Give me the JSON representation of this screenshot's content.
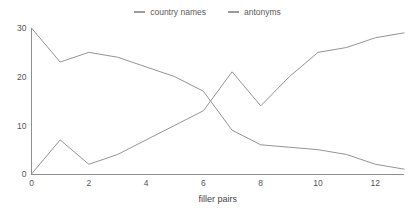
{
  "chart_data": {
    "type": "line",
    "title": "",
    "xlabel": "filler pairs",
    "ylabel": "",
    "xlim": [
      0,
      13
    ],
    "ylim": [
      0,
      30
    ],
    "xticks": [
      0,
      2,
      4,
      6,
      8,
      10,
      12
    ],
    "yticks": [
      0,
      10,
      20,
      30
    ],
    "grid": false,
    "legend_position": "top-center",
    "x": [
      0,
      1,
      2,
      3,
      4,
      5,
      6,
      7,
      8,
      9,
      10,
      11,
      12,
      13
    ],
    "series": [
      {
        "name": "country names",
        "color": "#949494",
        "values": [
          30,
          23,
          25,
          24,
          22,
          20,
          17,
          9,
          6,
          5.5,
          5,
          4,
          2,
          1
        ]
      },
      {
        "name": "antonyms",
        "color": "#949494",
        "values": [
          0,
          7,
          2,
          4,
          7,
          10,
          13,
          21,
          14,
          20,
          25,
          26,
          28,
          29
        ]
      }
    ]
  },
  "legend": {
    "items": [
      {
        "label": "country names",
        "color": "#949494"
      },
      {
        "label": "antonyms",
        "color": "#949494"
      }
    ]
  },
  "axes": {
    "x_tick_labels": [
      "0",
      "2",
      "4",
      "6",
      "8",
      "10",
      "12"
    ],
    "y_tick_labels": [
      "0",
      "10",
      "20",
      "30"
    ],
    "x_axis_title": "filler pairs"
  }
}
